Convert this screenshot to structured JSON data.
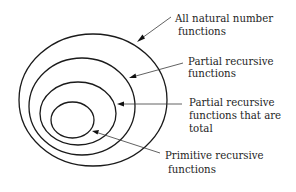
{
  "diagram": {
    "type": "nested-set-diagram",
    "sets": [
      {
        "id": "all-natural-number-functions",
        "label_lines": [
          "All natural number",
          "functions"
        ]
      },
      {
        "id": "partial-recursive-functions",
        "label_lines": [
          "Partial recursive",
          "functions"
        ]
      },
      {
        "id": "partial-recursive-total-functions",
        "label_lines": [
          "Partial recursive",
          "functions that are",
          "total"
        ]
      },
      {
        "id": "primitive-recursive-functions",
        "label_lines": [
          "Primitive recursive",
          "functions"
        ]
      }
    ],
    "colors": {
      "stroke": "#1a1a1a",
      "text": "#1e1e1e",
      "background": "#ffffff"
    }
  }
}
